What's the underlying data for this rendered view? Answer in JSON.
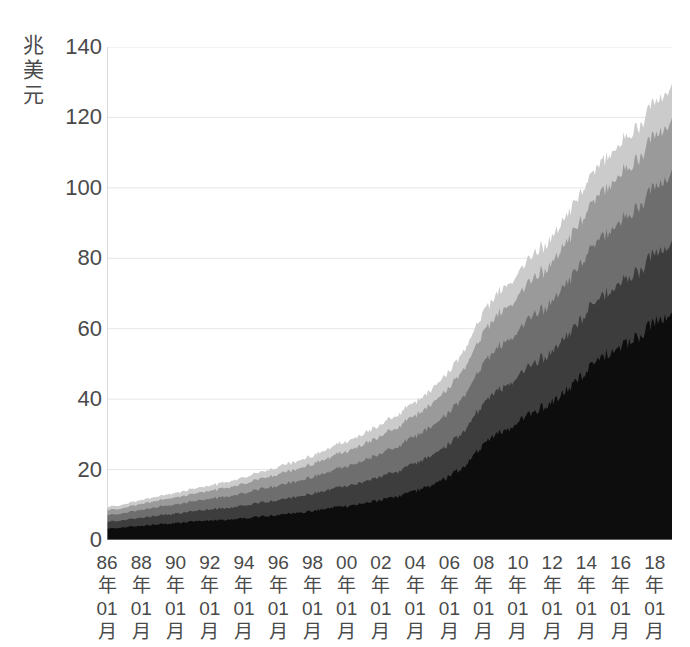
{
  "chart_data": {
    "type": "area",
    "stacked": true,
    "title": "",
    "subtitle": "",
    "xlabel": "",
    "ylabel": "兆美元",
    "ylabel_chars": [
      "兆",
      "美",
      "元"
    ],
    "ylim": [
      0,
      140
    ],
    "yticks": [
      140,
      120,
      100,
      80,
      60,
      40,
      20,
      0
    ],
    "ytick_labels": [
      "140",
      "120",
      "100",
      "80",
      "60",
      "40",
      "20",
      "0"
    ],
    "grid": true,
    "grid_axis": "y",
    "legend": "none",
    "x_tick_year_suffix": "年",
    "x_tick_month": "01",
    "x_tick_month_suffix": "月",
    "x_tick_years": [
      "86",
      "88",
      "90",
      "92",
      "94",
      "96",
      "98",
      "00",
      "02",
      "04",
      "06",
      "08",
      "10",
      "12",
      "14",
      "16",
      "18"
    ],
    "categories": [
      "86年01月",
      "87年01月",
      "88年01月",
      "89年01月",
      "90年01月",
      "91年01月",
      "92年01月",
      "93年01月",
      "94年01月",
      "95年01月",
      "96年01月",
      "97年01月",
      "98年01月",
      "99年01月",
      "00年01月",
      "01年01月",
      "02年01月",
      "03年01月",
      "04年01月",
      "05年01月",
      "06年01月",
      "07年01月",
      "08年01月",
      "09年01月",
      "10年01月",
      "11年01月",
      "12年01月",
      "13年01月",
      "14年01月",
      "15年01月",
      "16年01月",
      "17年01月",
      "18年01月",
      "19年01月"
    ],
    "series": [
      {
        "name": "layer-1",
        "color": "#0d0d0d",
        "values": [
          3.2,
          3.6,
          4.0,
          4.4,
          4.8,
          5.2,
          5.5,
          5.8,
          6.2,
          6.6,
          7.1,
          7.6,
          8.2,
          8.9,
          9.6,
          10.4,
          11.3,
          12.4,
          13.8,
          15.6,
          18.0,
          21.5,
          27.0,
          30.5,
          33.0,
          36.5,
          39.0,
          43.0,
          48.0,
          52.0,
          54.5,
          57.5,
          61.5,
          63.0
        ]
      },
      {
        "name": "layer-2",
        "color": "#3d3d3d",
        "values": [
          1.9,
          2.1,
          2.3,
          2.5,
          2.7,
          2.9,
          3.1,
          3.3,
          3.6,
          3.9,
          4.2,
          4.5,
          4.9,
          5.3,
          5.7,
          6.1,
          6.6,
          7.1,
          7.7,
          8.4,
          9.2,
          10.2,
          11.5,
          12.3,
          13.0,
          13.8,
          14.5,
          15.5,
          16.5,
          17.2,
          17.8,
          18.5,
          19.5,
          20.0
        ]
      },
      {
        "name": "layer-3",
        "color": "#6e6e6e",
        "values": [
          1.8,
          2.0,
          2.2,
          2.4,
          2.6,
          2.8,
          3.0,
          3.2,
          3.5,
          3.8,
          4.1,
          4.4,
          4.8,
          5.2,
          5.6,
          6.0,
          6.5,
          7.0,
          7.6,
          8.3,
          9.1,
          10.1,
          11.4,
          12.2,
          12.9,
          13.6,
          14.2,
          15.2,
          16.2,
          16.9,
          17.4,
          18.1,
          19.0,
          19.5
        ]
      },
      {
        "name": "layer-4",
        "color": "#9a9a9a",
        "values": [
          1.4,
          1.5,
          1.7,
          1.8,
          2.0,
          2.1,
          2.3,
          2.5,
          2.7,
          2.9,
          3.2,
          3.4,
          3.7,
          4.0,
          4.3,
          4.6,
          5.0,
          5.4,
          5.9,
          6.4,
          7.0,
          7.8,
          8.8,
          9.4,
          9.9,
          10.4,
          10.9,
          11.6,
          12.4,
          12.9,
          13.3,
          13.8,
          14.5,
          14.9
        ]
      },
      {
        "name": "layer-5",
        "color": "#cbcbcb",
        "values": [
          0.9,
          1.0,
          1.1,
          1.2,
          1.3,
          1.4,
          1.5,
          1.6,
          1.8,
          1.9,
          2.1,
          2.2,
          2.4,
          2.6,
          2.8,
          3.0,
          3.3,
          3.5,
          3.8,
          4.2,
          4.6,
          5.1,
          5.8,
          6.2,
          6.5,
          6.8,
          7.2,
          7.6,
          8.1,
          8.5,
          8.7,
          9.1,
          9.5,
          9.8
        ]
      }
    ],
    "totals_note": "",
    "axis_color": "#b5b5b5",
    "grid_color": "#e6e6e6",
    "text_color": "#4a4a4a"
  }
}
